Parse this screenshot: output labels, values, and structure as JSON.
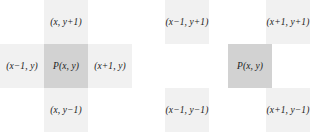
{
  "figure": {
    "type": "pixel-neighbourhood-diagram",
    "panel_count": 2,
    "colors": {
      "background": "#ffffff",
      "neighbor_fill": "#f1f1f1",
      "center_fill": "#d2d2d2",
      "label_text": "#1b1b1b"
    }
  },
  "left_panel": {
    "name": "4-connected neighbourhood",
    "cells": {
      "top": "(x, y+1)",
      "left": "(x−1, y)",
      "center": "P(x, y)",
      "right": "(x+1, y)",
      "bottom": "(x, y−1)"
    }
  },
  "right_panel": {
    "name": "diagonal neighbourhood",
    "cells": {
      "top_left": "(x−1, y+1)",
      "top_right": "(x+1, y+1)",
      "center": "P(x, y)",
      "bottom_left": "(x−1, y−1)",
      "bottom_right": "(x+1, y−1)"
    }
  }
}
